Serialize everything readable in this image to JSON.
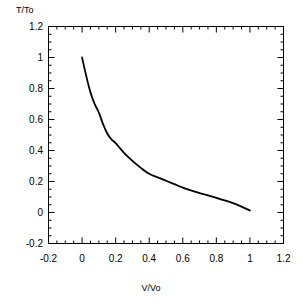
{
  "chart_data": {
    "type": "line",
    "title": "",
    "xlabel": "V/Vo",
    "ylabel": "T/To",
    "xlim": [
      -0.2,
      1.2
    ],
    "ylim": [
      -0.2,
      1.2
    ],
    "xticks": [
      "-0.2",
      "0",
      "0.2",
      "0.4",
      "0.6",
      "0.8",
      "1",
      "1.2"
    ],
    "xtick_values": [
      -0.2,
      0,
      0.2,
      0.4,
      0.6,
      0.8,
      1,
      1.2
    ],
    "yticks": [
      "1.2",
      "1",
      "0.8",
      "0.6",
      "0.4",
      "0.2",
      "0",
      "-0.2"
    ],
    "ytick_values": [
      1.2,
      1.0,
      0.8,
      0.6,
      0.4,
      0.2,
      0,
      -0.2
    ],
    "grid": false,
    "legend": null,
    "minor_ticks_per_major": 4,
    "line_color": "#000000",
    "line_width": 1.8,
    "series": [
      {
        "name": "T/To vs V/Vo",
        "x": [
          0.0,
          0.025,
          0.05,
          0.075,
          0.1,
          0.125,
          0.15,
          0.175,
          0.2,
          0.25,
          0.3,
          0.35,
          0.4,
          0.45,
          0.5,
          0.55,
          0.6,
          0.65,
          0.7,
          0.75,
          0.8,
          0.85,
          0.9,
          0.95,
          1.0
        ],
        "y": [
          1.0,
          0.88,
          0.775,
          0.7,
          0.645,
          0.57,
          0.51,
          0.472,
          0.447,
          0.385,
          0.333,
          0.288,
          0.25,
          0.227,
          0.205,
          0.183,
          0.16,
          0.142,
          0.125,
          0.11,
          0.094,
          0.078,
          0.06,
          0.038,
          0.013
        ]
      }
    ]
  },
  "axes": {
    "ylabel_text": "T/To",
    "xlabel_text": "V/Vo"
  }
}
